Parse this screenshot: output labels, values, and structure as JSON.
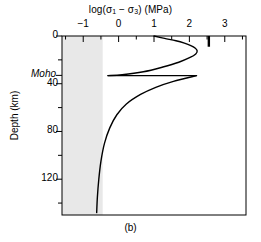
{
  "caption": "(b)",
  "chart_data": {
    "type": "line",
    "title_parts": {
      "prefix": "log(σ",
      "sub1": "1",
      "middle": " − σ",
      "sub2": "3",
      "suffix": ") (MPa)"
    },
    "xlabel": "log(σ₁ − σ₃) (MPa)",
    "ylabel": "Depth (km)",
    "xlim": [
      -1.6,
      3.6
    ],
    "ylim": [
      0,
      150
    ],
    "y_inverted": true,
    "grid": false,
    "legend": "none",
    "xticks": [
      -1,
      0,
      1,
      2,
      3
    ],
    "xtick_labels": [
      "−1",
      "0",
      "1",
      "2",
      "3"
    ],
    "xtick_minor": [
      -1.5,
      -0.5,
      0.5,
      1.5,
      2.5,
      3.5
    ],
    "yticks": [
      0,
      40,
      80,
      120
    ],
    "ytick_labels": [
      "0",
      "40",
      "80",
      "120"
    ],
    "ytick_minor": [
      20,
      60,
      100,
      140
    ],
    "special_ytick": {
      "label": "Moho",
      "depth": 33
    },
    "shaded_region": {
      "label": "weak-strength field",
      "x_from": -1.6,
      "x_to": -0.45,
      "color": "#e8e8e8"
    },
    "annotations": [
      {
        "name": "reference-stress-mark",
        "x": 2.55,
        "depth_from": 0,
        "depth_to": 9
      }
    ],
    "series": [
      {
        "name": "crustal-brittle-ductile-envelope",
        "comment": "upper lobe: brittle frictional branch from surface to ~14 km, ductile branch back to Moho",
        "points": [
          {
            "x": 1.0,
            "depth": 0
          },
          {
            "x": 1.3,
            "depth": 2
          },
          {
            "x": 1.62,
            "depth": 4
          },
          {
            "x": 1.86,
            "depth": 6
          },
          {
            "x": 2.04,
            "depth": 8
          },
          {
            "x": 2.16,
            "depth": 10
          },
          {
            "x": 2.22,
            "depth": 12.5
          },
          {
            "x": 2.18,
            "depth": 15
          },
          {
            "x": 2.02,
            "depth": 18
          },
          {
            "x": 1.7,
            "depth": 22
          },
          {
            "x": 1.25,
            "depth": 26
          },
          {
            "x": 0.7,
            "depth": 30
          },
          {
            "x": 0.1,
            "depth": 32.5
          },
          {
            "x": -0.3,
            "depth": 33.2
          }
        ]
      },
      {
        "name": "moho-strength-jump",
        "comment": "horizontal jump at Moho from weak lower crust to strong upper mantle",
        "points": [
          {
            "x": -0.3,
            "depth": 33.2
          },
          {
            "x": 2.2,
            "depth": 33.2
          }
        ]
      },
      {
        "name": "mantle-ductile-envelope",
        "comment": "upper mantle strength decaying exponentially with depth",
        "points": [
          {
            "x": 2.2,
            "depth": 33.2
          },
          {
            "x": 1.55,
            "depth": 38
          },
          {
            "x": 1.05,
            "depth": 43
          },
          {
            "x": 0.62,
            "depth": 49
          },
          {
            "x": 0.22,
            "depth": 57
          },
          {
            "x": -0.05,
            "depth": 66
          },
          {
            "x": -0.25,
            "depth": 77
          },
          {
            "x": -0.4,
            "depth": 90
          },
          {
            "x": -0.5,
            "depth": 105
          },
          {
            "x": -0.56,
            "depth": 120
          },
          {
            "x": -0.6,
            "depth": 135
          },
          {
            "x": -0.62,
            "depth": 148
          }
        ]
      }
    ]
  },
  "colors": {
    "line": "#000000",
    "axis": "#000000",
    "shading": "#e8e8e8",
    "background": "#ffffff"
  }
}
